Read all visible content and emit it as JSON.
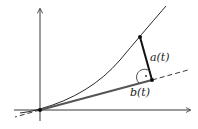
{
  "diagram": {
    "labels": {
      "a": "a(t)",
      "b": "b(t)"
    },
    "colors": {
      "curve": "#111111",
      "segment": "#111111",
      "tangent_fill": "#555555"
    }
  }
}
